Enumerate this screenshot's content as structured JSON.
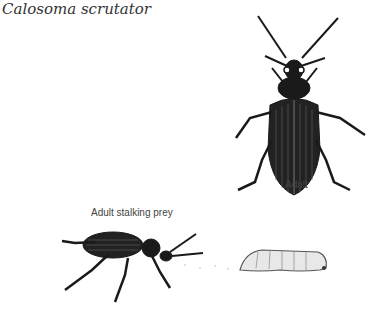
{
  "title": "Calosoma scrutator",
  "figures": [
    {
      "name": "adult-beetle-top-view",
      "caption": "Adult"
    },
    {
      "name": "adult-stalking-prey",
      "caption": "Adult stalking prey"
    },
    {
      "name": "caterpillar-prey",
      "caption": ""
    }
  ]
}
